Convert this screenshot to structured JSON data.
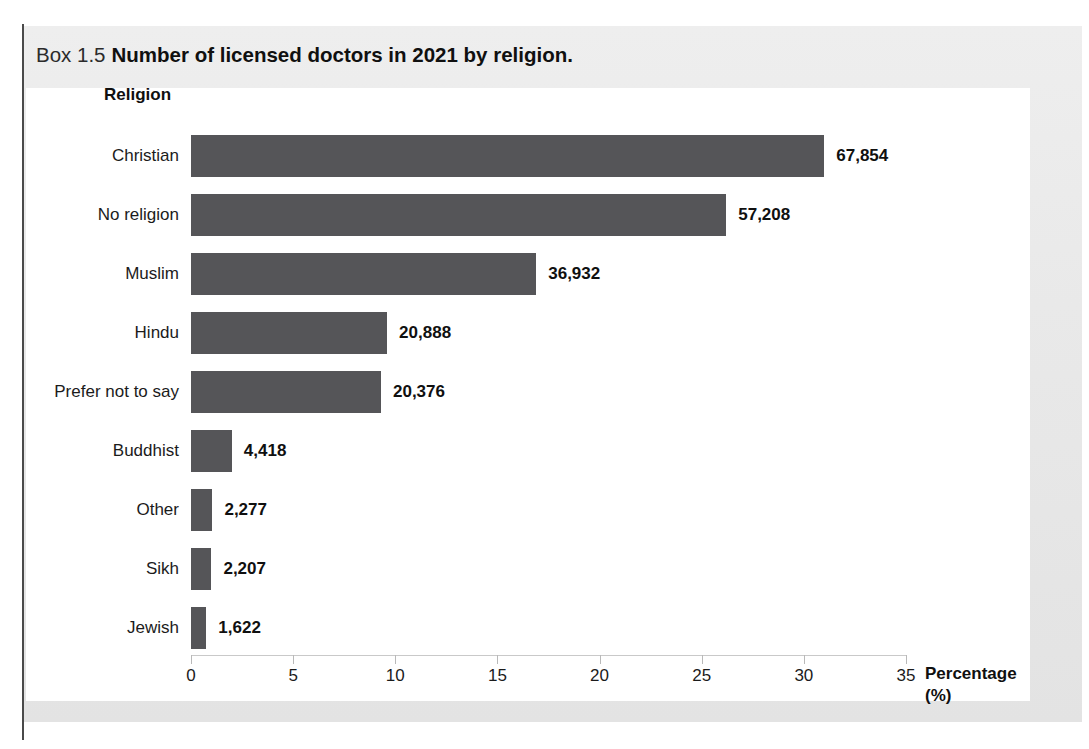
{
  "figure": {
    "box_number": "Box 1.5",
    "caption": "Number of licensed doctors in 2021 by religion."
  },
  "chart_data": {
    "type": "bar",
    "orientation": "horizontal",
    "title": "Number of licensed doctors in 2021 by religion.",
    "xlabel": "Percentage (%)",
    "xlabel_line1": "Percentage",
    "xlabel_line2": "(%)",
    "ylabel": "Religion",
    "xlim": [
      0,
      35
    ],
    "xticks": [
      "0",
      "5",
      "10",
      "15",
      "20",
      "25",
      "30",
      "35"
    ],
    "grid": false,
    "legend": "none",
    "bar_color": "#555558",
    "categories": [
      "Christian",
      "No religion",
      "Muslim",
      "Hindu",
      "Prefer not to say",
      "Buddhist",
      "Other",
      "Sikh",
      "Jewish"
    ],
    "values": [
      31.0,
      26.2,
      16.9,
      9.6,
      9.3,
      2.0,
      1.05,
      1.0,
      0.75
    ],
    "counts": [
      67854,
      57208,
      36932,
      20888,
      20376,
      4418,
      2277,
      2207,
      1622
    ],
    "data_labels": [
      "67,854",
      "57,208",
      "36,932",
      "20,888",
      "20,376",
      "4,418",
      "2,277",
      "2,207",
      "1,622"
    ]
  }
}
